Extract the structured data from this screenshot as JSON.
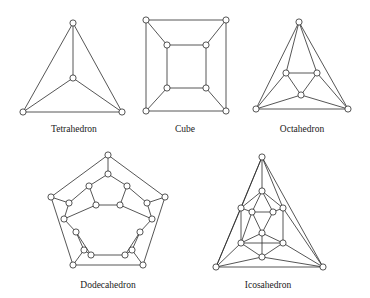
{
  "figure": {
    "background_color": "#ffffff",
    "edge_color": "#2b2b2b",
    "vertex_fill_color": "#ffffff",
    "vertex_stroke_color": "#2b2b2b",
    "label_color": "#1a1a1a",
    "vertex_radius": 3.1
  },
  "solids": [
    {
      "id": "tetrahedron",
      "label": "Tetrahedron",
      "label_x": 74,
      "label_y": 132,
      "vertex_count": 4,
      "edge_count": 6,
      "vertices": [
        {
          "id": "t0",
          "x": 73,
          "y": 23
        },
        {
          "id": "t1",
          "x": 73,
          "y": 78
        },
        {
          "id": "t2",
          "x": 23,
          "y": 112
        },
        {
          "id": "t3",
          "x": 122,
          "y": 112
        }
      ],
      "edges": [
        [
          0,
          1
        ],
        [
          0,
          2
        ],
        [
          0,
          3
        ],
        [
          1,
          2
        ],
        [
          1,
          3
        ],
        [
          2,
          3
        ]
      ]
    },
    {
      "id": "cube",
      "label": "Cube",
      "label_x": 185,
      "label_y": 132,
      "vertex_count": 8,
      "edge_count": 12,
      "vertices": [
        {
          "id": "c0",
          "x": 146,
          "y": 20
        },
        {
          "id": "c1",
          "x": 226,
          "y": 20
        },
        {
          "id": "c2",
          "x": 226,
          "y": 111
        },
        {
          "id": "c3",
          "x": 146,
          "y": 111
        },
        {
          "id": "c4",
          "x": 167,
          "y": 45
        },
        {
          "id": "c5",
          "x": 206,
          "y": 45
        },
        {
          "id": "c6",
          "x": 206,
          "y": 88
        },
        {
          "id": "c7",
          "x": 167,
          "y": 88
        }
      ],
      "edges": [
        [
          0,
          1
        ],
        [
          1,
          2
        ],
        [
          2,
          3
        ],
        [
          3,
          0
        ],
        [
          4,
          5
        ],
        [
          5,
          6
        ],
        [
          6,
          7
        ],
        [
          7,
          4
        ],
        [
          0,
          4
        ],
        [
          1,
          5
        ],
        [
          2,
          6
        ],
        [
          3,
          7
        ]
      ]
    },
    {
      "id": "octahedron",
      "label": "Octahedron",
      "label_x": 302,
      "label_y": 132,
      "vertex_count": 6,
      "edge_count": 12,
      "vertices": [
        {
          "id": "o0",
          "x": 299,
          "y": 22
        },
        {
          "id": "o1",
          "x": 256,
          "y": 109
        },
        {
          "id": "o2",
          "x": 348,
          "y": 109
        },
        {
          "id": "o3",
          "x": 286,
          "y": 73
        },
        {
          "id": "o4",
          "x": 317,
          "y": 73
        },
        {
          "id": "o5",
          "x": 301,
          "y": 95
        }
      ],
      "edges": [
        [
          0,
          1
        ],
        [
          1,
          2
        ],
        [
          2,
          0
        ],
        [
          3,
          4
        ],
        [
          4,
          5
        ],
        [
          5,
          3
        ],
        [
          0,
          3
        ],
        [
          0,
          4
        ],
        [
          1,
          3
        ],
        [
          1,
          5
        ],
        [
          2,
          4
        ],
        [
          2,
          5
        ]
      ]
    },
    {
      "id": "dodecahedron",
      "label": "Dodecahedron",
      "label_x": 108,
      "label_y": 288,
      "vertex_count": 20,
      "edge_count": 30,
      "vertices": [
        {
          "id": "d0",
          "x": 108,
          "y": 155
        },
        {
          "id": "d1",
          "x": 165,
          "y": 197
        },
        {
          "id": "d2",
          "x": 143,
          "y": 265
        },
        {
          "id": "d3",
          "x": 73,
          "y": 265
        },
        {
          "id": "d4",
          "x": 51,
          "y": 197
        },
        {
          "id": "d5",
          "x": 108,
          "y": 174
        },
        {
          "id": "d6",
          "x": 147,
          "y": 203
        },
        {
          "id": "d7",
          "x": 132,
          "y": 250
        },
        {
          "id": "d8",
          "x": 84,
          "y": 250
        },
        {
          "id": "d9",
          "x": 69,
          "y": 203
        },
        {
          "id": "d10",
          "x": 89,
          "y": 186
        },
        {
          "id": "d11",
          "x": 127,
          "y": 186
        },
        {
          "id": "d12",
          "x": 152,
          "y": 219
        },
        {
          "id": "d13",
          "x": 140,
          "y": 232
        },
        {
          "id": "d14",
          "x": 125,
          "y": 255
        },
        {
          "id": "d15",
          "x": 91,
          "y": 255
        },
        {
          "id": "d16",
          "x": 76,
          "y": 232
        },
        {
          "id": "d17",
          "x": 64,
          "y": 219
        },
        {
          "id": "d18",
          "x": 96,
          "y": 205
        },
        {
          "id": "d19",
          "x": 120,
          "y": 205
        }
      ],
      "edges": [
        [
          0,
          1
        ],
        [
          1,
          2
        ],
        [
          2,
          3
        ],
        [
          3,
          4
        ],
        [
          4,
          0
        ],
        [
          0,
          5
        ],
        [
          1,
          6
        ],
        [
          2,
          7
        ],
        [
          3,
          8
        ],
        [
          4,
          9
        ],
        [
          5,
          10
        ],
        [
          5,
          11
        ],
        [
          6,
          11
        ],
        [
          6,
          12
        ],
        [
          7,
          13
        ],
        [
          7,
          14
        ],
        [
          8,
          15
        ],
        [
          8,
          16
        ],
        [
          9,
          17
        ],
        [
          9,
          10
        ],
        [
          10,
          18
        ],
        [
          11,
          19
        ],
        [
          12,
          13
        ],
        [
          12,
          19
        ],
        [
          13,
          14
        ],
        [
          14,
          15
        ],
        [
          15,
          16
        ],
        [
          16,
          17
        ],
        [
          17,
          18
        ],
        [
          18,
          19
        ]
      ]
    },
    {
      "id": "icosahedron",
      "label": "Icosahedron",
      "label_x": 268,
      "label_y": 288,
      "vertex_count": 12,
      "edge_count": 30,
      "vertices": [
        {
          "id": "i0",
          "x": 262,
          "y": 157
        },
        {
          "id": "i1",
          "x": 216,
          "y": 267
        },
        {
          "id": "i2",
          "x": 323,
          "y": 267
        },
        {
          "id": "i3",
          "x": 262,
          "y": 191
        },
        {
          "id": "i4",
          "x": 241,
          "y": 208
        },
        {
          "id": "i5",
          "x": 283,
          "y": 208
        },
        {
          "id": "i6",
          "x": 241,
          "y": 243
        },
        {
          "id": "i7",
          "x": 283,
          "y": 243
        },
        {
          "id": "i8",
          "x": 262,
          "y": 257
        },
        {
          "id": "i9",
          "x": 252,
          "y": 212
        },
        {
          "id": "i10",
          "x": 273,
          "y": 212
        },
        {
          "id": "i11",
          "x": 262,
          "y": 233
        }
      ],
      "edges": [
        [
          0,
          1
        ],
        [
          1,
          2
        ],
        [
          2,
          0
        ],
        [
          0,
          3
        ],
        [
          0,
          4
        ],
        [
          0,
          5
        ],
        [
          1,
          4
        ],
        [
          1,
          6
        ],
        [
          1,
          8
        ],
        [
          2,
          5
        ],
        [
          2,
          7
        ],
        [
          2,
          8
        ],
        [
          3,
          4
        ],
        [
          3,
          5
        ],
        [
          4,
          6
        ],
        [
          5,
          7
        ],
        [
          6,
          7
        ],
        [
          6,
          8
        ],
        [
          7,
          8
        ],
        [
          3,
          9
        ],
        [
          3,
          10
        ],
        [
          9,
          10
        ],
        [
          4,
          9
        ],
        [
          5,
          10
        ],
        [
          9,
          11
        ],
        [
          10,
          11
        ],
        [
          6,
          11
        ],
        [
          7,
          11
        ],
        [
          8,
          11
        ],
        [
          9,
          6
        ]
      ]
    }
  ]
}
